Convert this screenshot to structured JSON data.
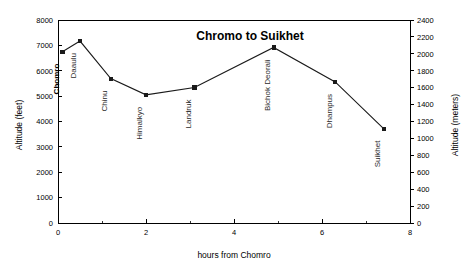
{
  "chart_data": {
    "type": "line",
    "title": "Chromo to Suikhet",
    "xlabel": "hours from Chomro",
    "ylabel": "Altitude (feet)",
    "ylabel_right": "Altitude (meters)",
    "xlim": [
      0,
      8
    ],
    "ylim": [
      0,
      8000
    ],
    "ylim_right": [
      0,
      2400
    ],
    "grid": false,
    "legend": "none",
    "xticks": [
      0,
      2,
      4,
      6,
      8
    ],
    "xticks_minor": [
      1,
      3,
      5,
      7
    ],
    "yticks": [
      0,
      1000,
      2000,
      3000,
      4000,
      5000,
      6000,
      7000,
      8000
    ],
    "yticks_right": [
      0,
      200,
      400,
      600,
      800,
      1000,
      1200,
      1400,
      1600,
      1800,
      2000,
      2200,
      2400
    ],
    "xtick_labels": [
      "0",
      "2",
      "4",
      "6",
      "8"
    ],
    "ytick_labels": [
      "0",
      "1000",
      "2000",
      "3000",
      "4000",
      "5000",
      "6000",
      "7000",
      "8000"
    ],
    "ytick_right_labels": [
      "0",
      "200",
      "400",
      "600",
      "800",
      "1000",
      "1200",
      "1400",
      "1600",
      "1800",
      "2000",
      "2200",
      "2400"
    ],
    "x": [
      0.1,
      0.5,
      1.2,
      2.0,
      3.1,
      4.9,
      6.3,
      7.4
    ],
    "values": [
      6750,
      7170,
      5690,
      5050,
      5340,
      6920,
      5560,
      3720
    ],
    "point_labels": [
      "Chomro",
      "Daaulu",
      "Chinu",
      "Himalkyo",
      "Landruk",
      "Bichok Deorali",
      "Dhampus",
      "Suikhet"
    ],
    "point_label_bold": [
      true,
      false,
      false,
      false,
      false,
      false,
      false,
      false
    ],
    "series_name": "Altitude profile",
    "marker": "square",
    "line_color": "#1a1a1a",
    "marker_color": "#1a1a1a"
  },
  "meta": {
    "background_color": "#ffffff",
    "axis_color": "#000000"
  }
}
